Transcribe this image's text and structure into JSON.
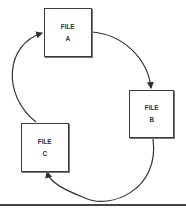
{
  "diagram": {
    "nodes": [
      {
        "id": "A",
        "line1": "FILE",
        "line2": "A"
      },
      {
        "id": "B",
        "line1": "FILE",
        "line2": "B"
      },
      {
        "id": "C",
        "line1": "FILE",
        "line2": "C"
      }
    ],
    "edges": [
      {
        "from": "A",
        "to": "B"
      },
      {
        "from": "B",
        "to": "C"
      },
      {
        "from": "C",
        "to": "A"
      }
    ],
    "colors": {
      "stroke": "#3a3a3a",
      "background": "#ffffff"
    }
  }
}
